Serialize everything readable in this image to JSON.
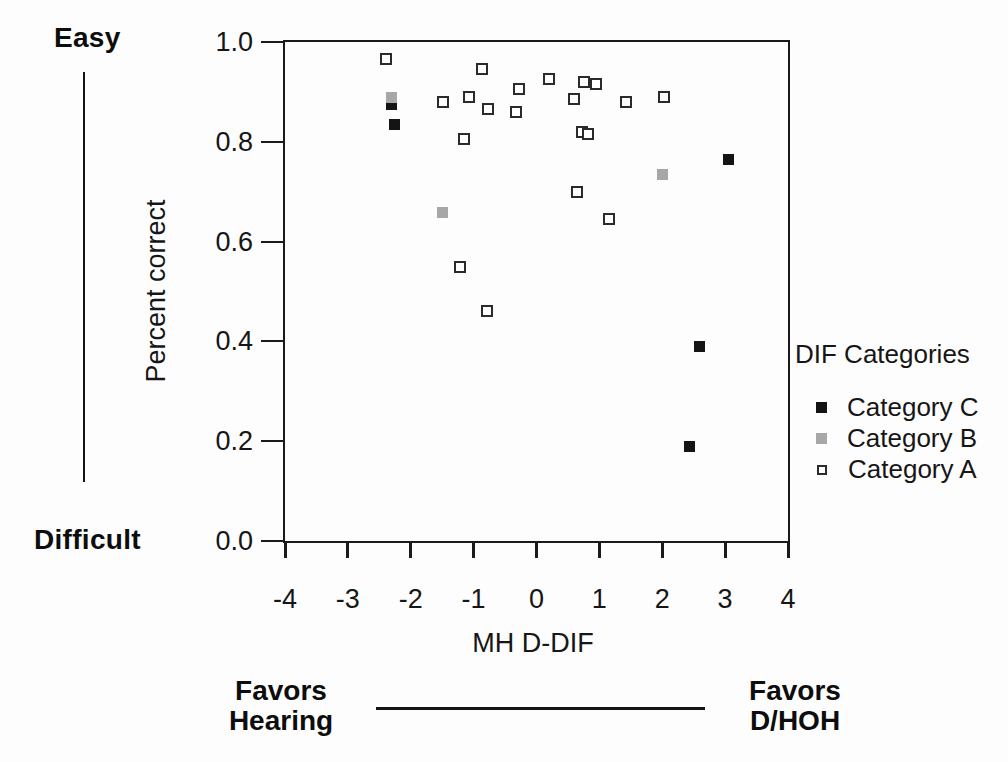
{
  "figure": {
    "easy_label": "Easy",
    "difficult_label": "Difficult",
    "favors_left": {
      "line1": "Favors",
      "line2": "Hearing"
    },
    "favors_right": {
      "line1": "Favors",
      "line2": "D/HOH"
    }
  },
  "legend": {
    "title": "DIF Categories",
    "items": [
      {
        "label": "Category C",
        "marker": "filled-square",
        "color": "#141414"
      },
      {
        "label": "Category B",
        "marker": "filled-square",
        "color": "#a7a7a7"
      },
      {
        "label": "Category A",
        "marker": "open-square",
        "color": "#2b2b2b"
      }
    ]
  },
  "chart_data": {
    "type": "scatter",
    "title": "",
    "xlabel": "MH D-DIF",
    "ylabel": "Percent correct",
    "xlim": [
      -4,
      4
    ],
    "ylim": [
      0.0,
      1.0
    ],
    "grid": false,
    "legend_position": "right",
    "x_ticks": [
      {
        "value": -4,
        "label": "-4"
      },
      {
        "value": -3,
        "label": "-3"
      },
      {
        "value": -2,
        "label": "-2"
      },
      {
        "value": -1,
        "label": "-1"
      },
      {
        "value": 0,
        "label": "0"
      },
      {
        "value": 1,
        "label": "1"
      },
      {
        "value": 2,
        "label": "2"
      },
      {
        "value": 3,
        "label": "3"
      },
      {
        "value": 4,
        "label": "4"
      }
    ],
    "y_ticks": [
      {
        "value": 1.0,
        "label": "1.0"
      },
      {
        "value": 0.8,
        "label": "0.8"
      },
      {
        "value": 0.6,
        "label": "0.6"
      },
      {
        "value": 0.4,
        "label": "0.4"
      },
      {
        "value": 0.2,
        "label": "0.2"
      },
      {
        "value": 0.0,
        "label": "0.0"
      }
    ],
    "series": [
      {
        "name": "Category C",
        "marker": "filled-square",
        "color": "#141414",
        "points": [
          [
            -2.32,
            0.875
          ],
          [
            -2.27,
            0.835
          ],
          [
            3.05,
            0.765
          ],
          [
            2.58,
            0.39
          ],
          [
            2.42,
            0.19
          ]
        ]
      },
      {
        "name": "Category B",
        "marker": "filled-square",
        "color": "#a7a7a7",
        "points": [
          [
            -2.32,
            0.89
          ],
          [
            -1.5,
            0.66
          ],
          [
            2.0,
            0.735
          ]
        ]
      },
      {
        "name": "Category A",
        "marker": "open-square",
        "color": "#2b2b2b",
        "points": [
          [
            -2.4,
            0.965
          ],
          [
            -0.86,
            0.945
          ],
          [
            0.2,
            0.925
          ],
          [
            0.75,
            0.92
          ],
          [
            0.94,
            0.915
          ],
          [
            -0.28,
            0.905
          ],
          [
            -1.07,
            0.89
          ],
          [
            2.02,
            0.89
          ],
          [
            0.59,
            0.885
          ],
          [
            -1.48,
            0.88
          ],
          [
            1.43,
            0.88
          ],
          [
            -0.77,
            0.865
          ],
          [
            -0.32,
            0.86
          ],
          [
            0.72,
            0.82
          ],
          [
            0.82,
            0.815
          ],
          [
            -1.15,
            0.805
          ],
          [
            0.64,
            0.7
          ],
          [
            1.16,
            0.645
          ],
          [
            -1.21,
            0.55
          ],
          [
            -0.78,
            0.46
          ]
        ]
      }
    ],
    "annotations": {
      "y_axis_top": "Easy",
      "y_axis_bottom": "Difficult",
      "x_axis_left": "Favors Hearing",
      "x_axis_right": "Favors D/HOH"
    }
  }
}
